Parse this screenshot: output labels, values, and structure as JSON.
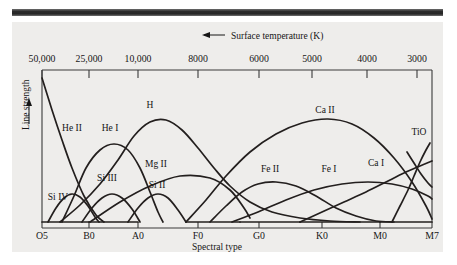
{
  "figure": {
    "top_axis_title": "Surface temperature (K)",
    "top_axis_arrow": "left-arrow-icon",
    "y_axis_title": "Line strength",
    "y_axis_arrow": "up-arrow-icon",
    "x_axis_title": "Spectral type"
  },
  "chart_data": {
    "type": "line",
    "title": "",
    "xlabel": "Spectral type",
    "ylabel": "Line strength",
    "top_axis_label": "Surface temperature (K)",
    "grid": false,
    "legend_position": "inline-curve-labels",
    "x_categories": [
      "O5",
      "B0",
      "A0",
      "F0",
      "G0",
      "K0",
      "M0",
      "M7"
    ],
    "x_tick_positions_px": [
      42,
      89,
      138,
      198,
      259,
      322,
      380,
      432
    ],
    "top_axis_ticks": [
      "50,000",
      "25,000",
      "10,000",
      "8000",
      "6000",
      "5000",
      "4000",
      "3000"
    ],
    "top_axis_tick_positions_px": [
      42,
      89,
      138,
      198,
      259,
      312,
      367,
      417
    ],
    "ylim": [
      0,
      1
    ],
    "ylabel_ticks": [],
    "series": [
      {
        "name": "He II",
        "label": "He II",
        "label_xy": [
          72,
          131
        ],
        "points": [
          [
            42,
            78
          ],
          [
            52,
            110
          ],
          [
            62,
            140
          ],
          [
            72,
            168
          ],
          [
            84,
            196
          ],
          [
            96,
            215
          ],
          [
            104,
            222
          ]
        ]
      },
      {
        "name": "He I",
        "label": "He I",
        "label_xy": [
          110,
          131
        ],
        "points": [
          [
            62,
            222
          ],
          [
            74,
            196
          ],
          [
            86,
            168
          ],
          [
            100,
            150
          ],
          [
            114,
            144
          ],
          [
            128,
            150
          ],
          [
            140,
            168
          ],
          [
            150,
            192
          ],
          [
            158,
            212
          ],
          [
            163,
            222
          ]
        ]
      },
      {
        "name": "Si IV",
        "label": "Si IV",
        "label_xy": [
          58,
          200
        ],
        "points": [
          [
            48,
            222
          ],
          [
            56,
            208
          ],
          [
            64,
            198
          ],
          [
            72,
            194
          ],
          [
            80,
            197
          ],
          [
            88,
            206
          ],
          [
            95,
            217
          ],
          [
            99,
            222
          ]
        ]
      },
      {
        "name": "Si III",
        "label": "Si III",
        "label_xy": [
          107,
          181
        ]
      },
      {
        "name": "Si III curve",
        "label": "",
        "points": [
          [
            82,
            222
          ],
          [
            92,
            208
          ],
          [
            102,
            198
          ],
          [
            112,
            194
          ],
          [
            122,
            198
          ],
          [
            132,
            209
          ],
          [
            140,
            222
          ]
        ]
      },
      {
        "name": "Si II",
        "label": "Si II",
        "label_xy": [
          157,
          188
        ],
        "points": [
          [
            128,
            222
          ],
          [
            138,
            208
          ],
          [
            148,
            198
          ],
          [
            158,
            194
          ],
          [
            168,
            198
          ],
          [
            178,
            210
          ],
          [
            186,
            222
          ]
        ]
      },
      {
        "name": "Mg II",
        "label": "Mg II",
        "label_xy": [
          156,
          167
        ],
        "points": [
          [
            90,
            222
          ],
          [
            120,
            202
          ],
          [
            150,
            186
          ],
          [
            180,
            176
          ],
          [
            210,
            178
          ],
          [
            230,
            190
          ],
          [
            244,
            208
          ],
          [
            250,
            218
          ]
        ]
      },
      {
        "name": "H",
        "label": "H",
        "label_xy": [
          150,
          108
        ],
        "points": [
          [
            60,
            222
          ],
          [
            80,
            205
          ],
          [
            100,
            184
          ],
          [
            118,
            160
          ],
          [
            134,
            136
          ],
          [
            150,
            122
          ],
          [
            166,
            120
          ],
          [
            182,
            130
          ],
          [
            198,
            148
          ],
          [
            214,
            168
          ],
          [
            230,
            186
          ],
          [
            250,
            202
          ],
          [
            272,
            212
          ],
          [
            300,
            218
          ],
          [
            330,
            221
          ],
          [
            360,
            222
          ]
        ]
      },
      {
        "name": "Fe II",
        "label": "Fe II",
        "label_xy": [
          270,
          172
        ],
        "points": [
          [
            210,
            222
          ],
          [
            226,
            206
          ],
          [
            242,
            192
          ],
          [
            258,
            184
          ],
          [
            276,
            182
          ],
          [
            296,
            186
          ],
          [
            316,
            196
          ],
          [
            336,
            208
          ],
          [
            356,
            216
          ],
          [
            376,
            221
          ],
          [
            394,
            222
          ]
        ]
      },
      {
        "name": "Fe I",
        "label": "Fe I",
        "label_xy": [
          329,
          172
        ],
        "points": [
          [
            232,
            222
          ],
          [
            258,
            212
          ],
          [
            286,
            200
          ],
          [
            314,
            190
          ],
          [
            342,
            184
          ],
          [
            368,
            182
          ],
          [
            392,
            184
          ],
          [
            412,
            189
          ],
          [
            428,
            196
          ],
          [
            432,
            199
          ]
        ]
      },
      {
        "name": "Ca II",
        "label": "Ca II",
        "label_xy": [
          325,
          113
        ],
        "points": [
          [
            186,
            222
          ],
          [
            206,
            200
          ],
          [
            226,
            176
          ],
          [
            250,
            152
          ],
          [
            276,
            134
          ],
          [
            302,
            123
          ],
          [
            328,
            119
          ],
          [
            352,
            124
          ],
          [
            374,
            138
          ],
          [
            394,
            158
          ],
          [
            412,
            182
          ],
          [
            426,
            206
          ],
          [
            432,
            219
          ]
        ]
      },
      {
        "name": "Ca I",
        "label": "Ca I",
        "label_xy": [
          376,
          166
        ],
        "points": [
          [
            300,
            222
          ],
          [
            322,
            212
          ],
          [
            344,
            202
          ],
          [
            366,
            192
          ],
          [
            386,
            182
          ],
          [
            404,
            173
          ],
          [
            420,
            166
          ],
          [
            432,
            161
          ]
        ]
      },
      {
        "name": "TiO",
        "label": "TiO",
        "label_xy": [
          419,
          135
        ],
        "points": [
          [
            392,
            222
          ],
          [
            400,
            206
          ],
          [
            408,
            190
          ],
          [
            414,
            176
          ],
          [
            420,
            162
          ],
          [
            426,
            150
          ],
          [
            430,
            143
          ]
        ]
      },
      {
        "name": "TiO branch",
        "label": "",
        "points": [
          [
            407,
            152
          ],
          [
            414,
            163
          ],
          [
            421,
            174
          ],
          [
            428,
            183
          ],
          [
            432,
            187
          ]
        ]
      }
    ],
    "baseline_segments_px": [
      [
        42,
        222,
        89,
        222
      ],
      [
        89,
        222,
        138,
        222
      ],
      [
        186,
        222,
        240,
        222
      ],
      [
        240,
        222,
        300,
        222
      ],
      [
        300,
        222,
        380,
        222
      ],
      [
        380,
        222,
        432,
        222
      ]
    ]
  }
}
